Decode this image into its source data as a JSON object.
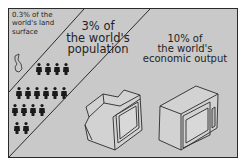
{
  "panels": [
    {
      "label": "0.3% of the world's land surface"
    },
    {
      "label_lines": [
        "3% of",
        "the world's",
        "population"
      ]
    },
    {
      "label_lines": [
        "10% of",
        "the world's",
        "economic output"
      ]
    }
  ],
  "land": {
    "line1": "0.3% of the",
    "line2": "world's land",
    "line3": "surface"
  },
  "population": {
    "line1": "3% of",
    "line2": "the world's",
    "line3": "population"
  },
  "economy": {
    "line1": "10% of",
    "line2": "the world's",
    "line3": "economic output"
  },
  "icons": [
    "country-map-icon",
    "person-icon",
    "television-icon",
    "microwave-icon"
  ],
  "person_rows": [
    4,
    6,
    4,
    2
  ],
  "colors": {
    "background": "#c9c9c9",
    "ink": "#1f1f1f",
    "frame": "#2a2a2a"
  }
}
